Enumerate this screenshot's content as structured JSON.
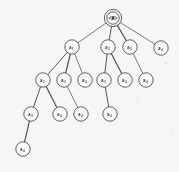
{
  "figure": {
    "type": "rooted-tree-diagram",
    "title": "",
    "background_color": "#fbfbfa",
    "ink_color": "#4a4a48",
    "node_fill": "#ffffff",
    "root_style": "double-circle",
    "root_glyph": "eye-mark",
    "node_radius": 7.2,
    "root_radius_inner": 6.2,
    "root_radius_outer": 8.6,
    "levels": 5
  },
  "nodes": [
    {
      "id": "root",
      "label": "a",
      "sub": "0",
      "display": "a0",
      "x": 113,
      "y": 18,
      "level": 0,
      "double_circle": true
    },
    {
      "id": "n1",
      "label": "a",
      "sub": "1",
      "display": "a1",
      "x": 72,
      "y": 47,
      "level": 1,
      "double_circle": false
    },
    {
      "id": "n2",
      "label": "a",
      "sub": "2",
      "display": "a2",
      "x": 108,
      "y": 47,
      "level": 1,
      "double_circle": false
    },
    {
      "id": "n3",
      "label": "a",
      "sub": "3",
      "display": "a3",
      "x": 130,
      "y": 47,
      "level": 1,
      "double_circle": false
    },
    {
      "id": "n4",
      "label": "a",
      "sub": "4",
      "display": "a4",
      "x": 161,
      "y": 48,
      "level": 1,
      "double_circle": false
    },
    {
      "id": "n5",
      "label": "a",
      "sub": "2",
      "display": "a2",
      "x": 43,
      "y": 80,
      "level": 2,
      "double_circle": false
    },
    {
      "id": "n6",
      "label": "a",
      "sub": "3",
      "display": "a3",
      "x": 64,
      "y": 80,
      "level": 2,
      "double_circle": false
    },
    {
      "id": "n7",
      "label": "a",
      "sub": "4",
      "display": "a4",
      "x": 85,
      "y": 80,
      "level": 2,
      "double_circle": false
    },
    {
      "id": "n8",
      "label": "a",
      "sub": "3",
      "display": "a3",
      "x": 104,
      "y": 80,
      "level": 2,
      "double_circle": false
    },
    {
      "id": "n9",
      "label": "a",
      "sub": "4",
      "display": "a4",
      "x": 125,
      "y": 80,
      "level": 2,
      "double_circle": false
    },
    {
      "id": "n10",
      "label": "a",
      "sub": "4",
      "display": "a4",
      "x": 146,
      "y": 80,
      "level": 2,
      "double_circle": false
    },
    {
      "id": "n11",
      "label": "a",
      "sub": "3",
      "display": "a3",
      "x": 31,
      "y": 114,
      "level": 3,
      "double_circle": false
    },
    {
      "id": "n12",
      "label": "a",
      "sub": "4",
      "display": "a4",
      "x": 60,
      "y": 114,
      "level": 3,
      "double_circle": false
    },
    {
      "id": "n13",
      "label": "a",
      "sub": "4",
      "display": "a4",
      "x": 81,
      "y": 114,
      "level": 3,
      "double_circle": false
    },
    {
      "id": "n14",
      "label": "a",
      "sub": "4",
      "display": "a4",
      "x": 110,
      "y": 114,
      "level": 3,
      "double_circle": false
    },
    {
      "id": "n15",
      "label": "a",
      "sub": "4",
      "display": "a4",
      "x": 23,
      "y": 149,
      "level": 4,
      "double_circle": false
    }
  ],
  "edges": [
    {
      "from": "root",
      "to": "n1"
    },
    {
      "from": "root",
      "to": "n2"
    },
    {
      "from": "root",
      "to": "n3"
    },
    {
      "from": "root",
      "to": "n4"
    },
    {
      "from": "n1",
      "to": "n5"
    },
    {
      "from": "n1",
      "to": "n6"
    },
    {
      "from": "n1",
      "to": "n7"
    },
    {
      "from": "n2",
      "to": "n8"
    },
    {
      "from": "n2",
      "to": "n9"
    },
    {
      "from": "n3",
      "to": "n10"
    },
    {
      "from": "n5",
      "to": "n11"
    },
    {
      "from": "n5",
      "to": "n12"
    },
    {
      "from": "n6",
      "to": "n13"
    },
    {
      "from": "n8",
      "to": "n14"
    },
    {
      "from": "n11",
      "to": "n15"
    }
  ],
  "specks": [
    {
      "x": 166,
      "y": 63,
      "r": 0.9
    },
    {
      "x": 137,
      "y": 99,
      "r": 0.7
    },
    {
      "x": 9,
      "y": 120,
      "r": 0.6
    },
    {
      "x": 172,
      "y": 133,
      "r": 0.7
    }
  ]
}
